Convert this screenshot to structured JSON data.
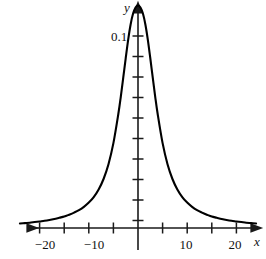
{
  "figure": {
    "name": "cauchy-density-graph",
    "background_color": "#ffffff",
    "line_color": "#000000",
    "axis_color": "#1a1a1a"
  },
  "axes": {
    "x_axis_label": "x",
    "y_axis_label": "y",
    "x_tick_labels": [
      {
        "value": -20,
        "text": "−20"
      },
      {
        "value": -10,
        "text": "−10"
      },
      {
        "value": 10,
        "text": "10"
      },
      {
        "value": 20,
        "text": "20"
      }
    ],
    "y_tick_labels": [
      {
        "value": 0.1,
        "text": "0.1"
      }
    ],
    "x_ticks": [
      -20,
      -15,
      -10,
      -5,
      5,
      10,
      15,
      20
    ],
    "y_ticks": [
      0.01,
      0.02,
      0.03,
      0.04,
      0.05,
      0.06,
      0.07,
      0.08,
      0.09,
      0.1
    ],
    "x_range": [
      -24,
      24
    ],
    "y_range": [
      0,
      0.119
    ],
    "x_arrow_both_ends": true,
    "y_arrow_top": true,
    "grid": false
  },
  "chart_data": {
    "type": "line",
    "title": "",
    "subtitle": "",
    "xlabel": "x",
    "ylabel": "y",
    "xlim": [
      -24,
      24
    ],
    "ylim": [
      0,
      0.119
    ],
    "grid": false,
    "legend_position": "none",
    "annotations": [],
    "series": [
      {
        "name": "density",
        "x": [
          -24,
          -23,
          -22,
          -21,
          -20,
          -19,
          -18,
          -17,
          -16,
          -15,
          -14,
          -13,
          -12,
          -11,
          -10,
          -9,
          -8,
          -7,
          -6,
          -5,
          -4,
          -3.5,
          -3,
          -2.5,
          -2,
          -1.5,
          -1,
          -0.5,
          0,
          0.5,
          1,
          1.5,
          2,
          2.5,
          3,
          3.5,
          4,
          5,
          6,
          7,
          8,
          9,
          10,
          11,
          12,
          13,
          14,
          15,
          16,
          17,
          18,
          19,
          20,
          21,
          22,
          23,
          24
        ],
        "y": [
          0.0022,
          0.0024,
          0.0026,
          0.0029,
          0.0032,
          0.0035,
          0.0039,
          0.0044,
          0.005,
          0.0056,
          0.0065,
          0.0075,
          0.0087,
          0.0103,
          0.0124,
          0.0151,
          0.0188,
          0.0239,
          0.0311,
          0.0414,
          0.0556,
          0.064,
          0.0733,
          0.0828,
          0.0918,
          0.0993,
          0.1046,
          0.1076,
          0.1086,
          0.1076,
          0.1046,
          0.0993,
          0.0918,
          0.0828,
          0.0733,
          0.064,
          0.0556,
          0.0414,
          0.0311,
          0.0239,
          0.0188,
          0.0151,
          0.0124,
          0.0103,
          0.0087,
          0.0075,
          0.0065,
          0.0056,
          0.005,
          0.0044,
          0.0039,
          0.0035,
          0.0032,
          0.0029,
          0.0026,
          0.0024,
          0.0022
        ]
      }
    ]
  },
  "geometry": {
    "origin_px": {
      "x": 138,
      "y": 228
    },
    "x_unit_px_per_5": 24.6,
    "y_unit_px_per_0_01": 20.5
  }
}
